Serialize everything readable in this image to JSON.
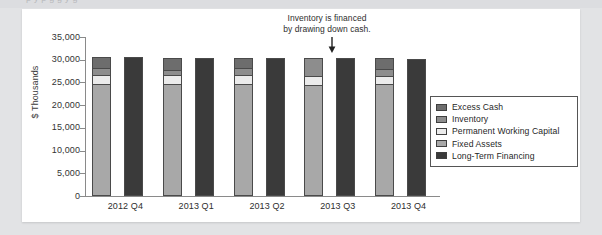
{
  "page": {
    "background_color": "#e2e3e5",
    "panel_color": "#ffffff",
    "top_sliver_text": "p    y    p    g   g  y           g"
  },
  "annotation": {
    "line1": "Inventory is financed",
    "line2": "by drawing down cash.",
    "arrow_icon": "down-arrow-icon"
  },
  "legend": {
    "position": "right-inside",
    "items": [
      {
        "label": "Excess Cash",
        "color": "#6d6d6d"
      },
      {
        "label": "Inventory",
        "color": "#8d8d8d"
      },
      {
        "label": "Permanent Working Capital",
        "color": "#ebebeb"
      },
      {
        "label": "Fixed Assets",
        "color": "#a8a8a8"
      },
      {
        "label": "Long-Term Financing",
        "color": "#3a3a3a"
      }
    ]
  },
  "chart_data": {
    "type": "bar",
    "title": "",
    "subtitle": "",
    "xlabel": "",
    "ylabel": "$ Thousands",
    "ylim": [
      0,
      35000
    ],
    "ytick_step": 5000,
    "ytick_labels": [
      "35,000",
      "30,000",
      "25,000",
      "20,000",
      "15,000",
      "10,000",
      "5,000",
      "0"
    ],
    "ytick_values": [
      35000,
      30000,
      25000,
      20000,
      15000,
      10000,
      5000,
      0
    ],
    "grid": false,
    "legend_position": "right",
    "categories": [
      "2012 Q4",
      "2013 Q1",
      "2013 Q2",
      "2013 Q3",
      "2013 Q4"
    ],
    "bar_groups": [
      {
        "category": "2012 Q4",
        "bars": [
          {
            "name": "Assets",
            "stacked": true,
            "segments": [
              {
                "name": "Fixed Assets",
                "value": 24900,
                "color": "#a8a8a8"
              },
              {
                "name": "Permanent Working Capital",
                "value": 1900,
                "color": "#ebebeb"
              },
              {
                "name": "Inventory",
                "value": 1600,
                "color": "#8d8d8d"
              },
              {
                "name": "Excess Cash",
                "value": 2100,
                "color": "#6d6d6d"
              }
            ],
            "total": 30500
          },
          {
            "name": "Long-Term Financing",
            "stacked": false,
            "segments": [
              {
                "name": "Long-Term Financing",
                "value": 30500,
                "color": "#3a3a3a"
              }
            ],
            "total": 30500
          }
        ]
      },
      {
        "category": "2013 Q1",
        "bars": [
          {
            "name": "Assets",
            "stacked": true,
            "segments": [
              {
                "name": "Fixed Assets",
                "value": 24900,
                "color": "#a8a8a8"
              },
              {
                "name": "Permanent Working Capital",
                "value": 2000,
                "color": "#ebebeb"
              },
              {
                "name": "Inventory",
                "value": 1100,
                "color": "#8d8d8d"
              },
              {
                "name": "Excess Cash",
                "value": 2400,
                "color": "#6d6d6d"
              }
            ],
            "total": 30400
          },
          {
            "name": "Long-Term Financing",
            "stacked": false,
            "segments": [
              {
                "name": "Long-Term Financing",
                "value": 30400,
                "color": "#3a3a3a"
              }
            ],
            "total": 30400
          }
        ]
      },
      {
        "category": "2013 Q2",
        "bars": [
          {
            "name": "Assets",
            "stacked": true,
            "segments": [
              {
                "name": "Fixed Assets",
                "value": 24700,
                "color": "#a8a8a8"
              },
              {
                "name": "Permanent Working Capital",
                "value": 2100,
                "color": "#ebebeb"
              },
              {
                "name": "Inventory",
                "value": 1600,
                "color": "#8d8d8d"
              },
              {
                "name": "Excess Cash",
                "value": 1900,
                "color": "#6d6d6d"
              }
            ],
            "total": 30300
          },
          {
            "name": "Long-Term Financing",
            "stacked": false,
            "segments": [
              {
                "name": "Long-Term Financing",
                "value": 30300,
                "color": "#3a3a3a"
              }
            ],
            "total": 30300
          }
        ]
      },
      {
        "category": "2013 Q3",
        "bars": [
          {
            "name": "Assets",
            "stacked": true,
            "segments": [
              {
                "name": "Fixed Assets",
                "value": 24600,
                "color": "#a8a8a8"
              },
              {
                "name": "Permanent Working Capital",
                "value": 1900,
                "color": "#ebebeb"
              },
              {
                "name": "Inventory",
                "value": 3900,
                "color": "#8d8d8d"
              },
              {
                "name": "Excess Cash",
                "value": 0,
                "color": "#6d6d6d"
              }
            ],
            "total": 30400
          },
          {
            "name": "Long-Term Financing",
            "stacked": false,
            "segments": [
              {
                "name": "Long-Term Financing",
                "value": 30400,
                "color": "#3a3a3a"
              }
            ],
            "total": 30400
          }
        ]
      },
      {
        "category": "2013 Q4",
        "bars": [
          {
            "name": "Assets",
            "stacked": true,
            "segments": [
              {
                "name": "Fixed Assets",
                "value": 24700,
                "color": "#a8a8a8"
              },
              {
                "name": "Permanent Working Capital",
                "value": 1800,
                "color": "#ebebeb"
              },
              {
                "name": "Inventory",
                "value": 1600,
                "color": "#8d8d8d"
              },
              {
                "name": "Excess Cash",
                "value": 2200,
                "color": "#6d6d6d"
              }
            ],
            "total": 30300
          },
          {
            "name": "Long-Term Financing",
            "stacked": false,
            "segments": [
              {
                "name": "Long-Term Financing",
                "value": 30250,
                "color": "#3a3a3a"
              }
            ],
            "total": 30250
          }
        ]
      }
    ]
  }
}
